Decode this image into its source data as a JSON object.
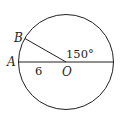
{
  "diagram": {
    "type": "circle-geometry",
    "circle": {
      "center_label": "O",
      "stroke_color": "#231f20"
    },
    "points": {
      "A": {
        "label": "A"
      },
      "B": {
        "label": "B"
      },
      "O": {
        "label": "O"
      }
    },
    "segments": [
      {
        "from": "A",
        "to": "O",
        "extends_to": "opposite-edge",
        "description": "diameter through A and O"
      },
      {
        "from": "B",
        "to": "O",
        "description": "radius OB"
      }
    ],
    "annotations": {
      "radius_length": "6",
      "angle": "150°"
    }
  }
}
